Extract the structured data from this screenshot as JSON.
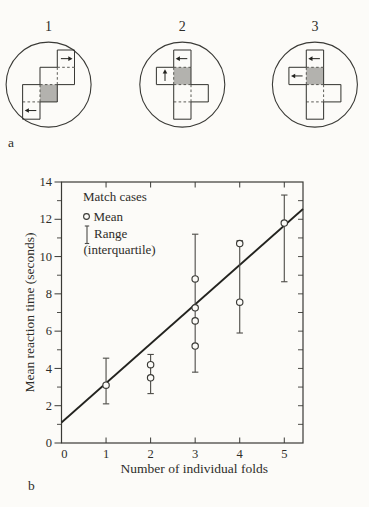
{
  "figure": {
    "panel_a_label": "a",
    "panel_b_label": "b"
  },
  "colors": {
    "outline": "#3a3a36",
    "fold_line": "#4a4944",
    "shade": "#b3b2ae",
    "paper": "#fcfbf8",
    "regression": "#23231f",
    "error_bar": "#4c4b47",
    "text": "#2e2d29"
  },
  "panel_a": {
    "label": "a",
    "stimuli": [
      {
        "label": "1",
        "cells": [
          [
            2,
            0
          ],
          [
            1,
            1
          ],
          [
            2,
            1
          ],
          [
            1,
            2
          ],
          [
            0,
            2
          ],
          [
            0,
            3
          ]
        ],
        "shaded": [
          1,
          2
        ],
        "arrows": [
          {
            "cell": [
              2,
              0
            ],
            "dir": "right"
          },
          {
            "cell": [
              0,
              3
            ],
            "dir": "left"
          }
        ]
      },
      {
        "label": "2",
        "cells": [
          [
            1,
            0
          ],
          [
            0,
            1
          ],
          [
            1,
            1
          ],
          [
            1,
            2
          ],
          [
            2,
            2
          ],
          [
            1,
            3
          ]
        ],
        "shaded": [
          1,
          1
        ],
        "arrows": [
          {
            "cell": [
              1,
              0
            ],
            "dir": "left"
          },
          {
            "cell": [
              0,
              1
            ],
            "dir": "up"
          }
        ]
      },
      {
        "label": "3",
        "cells": [
          [
            1,
            0
          ],
          [
            0,
            1
          ],
          [
            1,
            1
          ],
          [
            1,
            2
          ],
          [
            2,
            2
          ],
          [
            1,
            3
          ]
        ],
        "shaded": [
          1,
          1
        ],
        "arrows": [
          {
            "cell": [
              1,
              0
            ],
            "dir": "left"
          },
          {
            "cell": [
              0,
              1
            ],
            "dir": "left"
          }
        ]
      }
    ]
  },
  "panel_b": {
    "label": "b"
  },
  "chart_data": {
    "type": "scatter",
    "title": "",
    "xlabel": "Number of individual folds",
    "ylabel": "Mean reaction time (seconds)",
    "xlim": [
      0,
      5.42
    ],
    "ylim": [
      0,
      14
    ],
    "x_ticks": [
      0,
      1,
      2,
      3,
      4,
      5
    ],
    "y_ticks": [
      0,
      2,
      4,
      6,
      8,
      10,
      12,
      14
    ],
    "y_minor_ticks": [
      1,
      3,
      5,
      7,
      9,
      11,
      13
    ],
    "y_right_ticks": [
      1,
      2,
      3,
      4,
      5,
      6,
      7,
      8,
      9,
      10,
      11,
      12,
      13
    ],
    "grid": false,
    "legend_position": "top-left",
    "legend": {
      "title": "Match cases",
      "mean_label": "Mean",
      "range_label": "Range",
      "range_note": "(interquartile)"
    },
    "points": [
      {
        "x": 1,
        "means": [
          3.1
        ],
        "range": [
          2.1,
          4.55
        ]
      },
      {
        "x": 2,
        "means": [
          4.2,
          3.5
        ],
        "range": [
          2.65,
          4.75
        ]
      },
      {
        "x": 3,
        "means": [
          8.8,
          7.25,
          6.55,
          5.2
        ],
        "range": [
          3.8,
          11.2
        ]
      },
      {
        "x": 4,
        "means": [
          10.7,
          7.55
        ],
        "range": [
          5.9,
          10.85
        ]
      },
      {
        "x": 5,
        "means": [
          11.8
        ],
        "range": [
          8.65,
          13.3
        ]
      }
    ],
    "regression_line": {
      "x1": 0,
      "y1": 1.1,
      "x2": 5.42,
      "y2": 12.55
    }
  }
}
